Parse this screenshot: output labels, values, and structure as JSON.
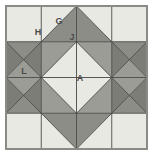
{
  "figure": {
    "type": "quilt-block",
    "grid": "4x4",
    "canvas": {
      "width": 153,
      "height": 156
    }
  },
  "colors": {
    "background": "#ffffff",
    "light": "#e9e9e4",
    "medium": "#9a9a95",
    "dark": "#7d7d79",
    "outline": "#4a4a4a",
    "frame": "#8a8a86",
    "label_text": "#4a4a4a"
  },
  "labels": [
    {
      "id": "H",
      "text": "H",
      "x": 38,
      "y": 33,
      "patch": "corner-square"
    },
    {
      "id": "G",
      "text": "G",
      "x": 59,
      "y": 22,
      "patch": "light-half-square-triangle"
    },
    {
      "id": "J",
      "text": "J",
      "x": 72,
      "y": 38,
      "patch": "dark-star-point-triangle"
    },
    {
      "id": "L",
      "text": "L",
      "x": 24,
      "y": 72,
      "patch": "hourglass-triangle"
    },
    {
      "id": "A",
      "text": "A",
      "x": 80,
      "y": 79,
      "patch": "center-square-on-point"
    }
  ],
  "frame": {
    "x": 6,
    "y": 6,
    "width": 141,
    "height": 143
  },
  "geometry": {
    "note": "Eight-pointed star block: light corner squares, light/dark half-square triangles on the edges, hourglass units left and right, central light square on point."
  }
}
